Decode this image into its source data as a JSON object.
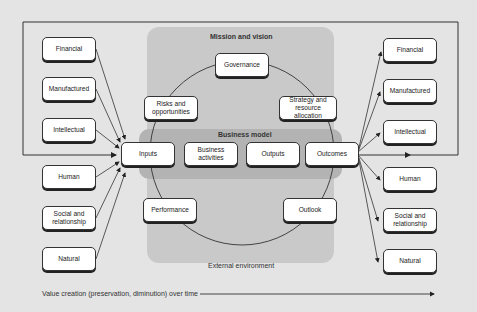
{
  "diagram": {
    "title_regions": {
      "mission_vision": "Mission and vision",
      "business_model": "Business model",
      "external_environment": "External environment"
    },
    "capitals_left": [
      "Financial",
      "Manufactured",
      "Intellectual",
      "Human",
      "Social and relationship",
      "Natural"
    ],
    "capitals_right": [
      "Financial",
      "Manufactured",
      "Intellectual",
      "Human",
      "Social and relationship",
      "Natural"
    ],
    "circle_elements": {
      "governance": "Governance",
      "risks": "Risks and opportunities",
      "strategy": "Strategy and resource allocation",
      "performance": "Performance",
      "outlook": "Outlook"
    },
    "business_model_steps": [
      "Inputs",
      "Business activities",
      "Outputs",
      "Outcomes"
    ],
    "timeline_label": "Value creation (preservation, diminution) over time",
    "colors": {
      "background": "#e4e4e4",
      "mission_panel": "#c9c9c9",
      "business_model_band": "#b3b3b3",
      "box_fill": "#ffffff",
      "line": "#333333"
    }
  }
}
